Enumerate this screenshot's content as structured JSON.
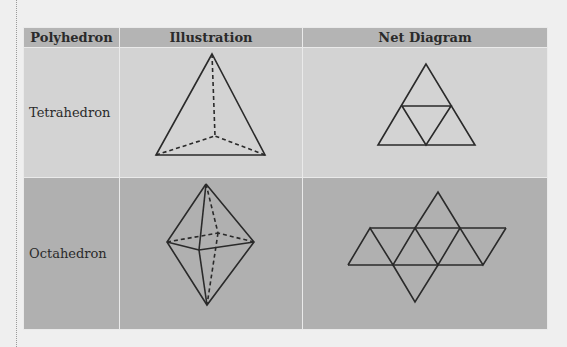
{
  "table": {
    "headers": [
      "Polyhedron",
      "Illustration",
      "Net Diagram"
    ],
    "rows": [
      {
        "name": "Tetrahedron",
        "illustration": "tetrahedron-3d-figure",
        "net": "tetrahedron-net-4-triangles"
      },
      {
        "name": "Octahedron",
        "illustration": "octahedron-3d-figure",
        "net": "octahedron-net-8-triangles"
      }
    ]
  },
  "colors": {
    "header_bg": "#b4b4b4",
    "row1_bg": "#d3d3d3",
    "row2_bg": "#b0b0b0",
    "page_bg": "#efefef",
    "line": "#2a2a2a"
  }
}
